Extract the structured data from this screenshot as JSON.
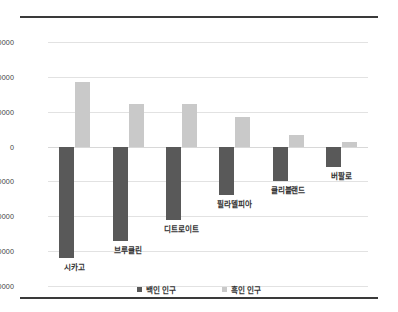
{
  "chart_data": {
    "type": "bar",
    "title": "",
    "xlabel": "",
    "ylabel": "",
    "ylim": [
      -2000000,
      1500000
    ],
    "ytick_step": 500000,
    "yticks": [
      "1500000",
      "1000000",
      "500000",
      "0",
      "-500000",
      "-1000000",
      "-1500000",
      "-2000000"
    ],
    "grid": true,
    "legend_position": "bottom",
    "categories": [
      "시카고",
      "브루클린",
      "디트로이트",
      "필라델피아",
      "클리블랜드",
      "버팔로"
    ],
    "series": [
      {
        "name": "백인 인구",
        "color": "#595959",
        "values": [
          -1600000,
          -1350000,
          -1050000,
          -690000,
          -490000,
          -300000
        ]
      },
      {
        "name": "흑인 인구",
        "color": "#c9c9c9",
        "values": [
          920000,
          610000,
          610000,
          420000,
          170000,
          70000
        ]
      }
    ]
  },
  "legend": {
    "items": [
      {
        "label": "백인 인구",
        "color": "#595959"
      },
      {
        "label": "흑인 인구",
        "color": "#c9c9c9"
      }
    ]
  },
  "colors": {
    "white_population": "#595959",
    "black_population": "#c9c9c9",
    "gridline": "#e2e2e2",
    "rule": "#3a3a3a",
    "text": "#333333",
    "background": "#ffffff"
  }
}
